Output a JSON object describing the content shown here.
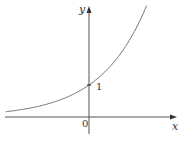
{
  "chart_data": {
    "type": "line",
    "title": "",
    "function": "y = 2^x",
    "xlabel": "x",
    "ylabel": "y",
    "origin_label": "0",
    "annotations": [
      {
        "x": 0,
        "y": 1,
        "label": "1"
      }
    ],
    "xlim": [
      -2.6,
      2.7
    ],
    "ylim": [
      -0.5,
      3.4
    ],
    "grid": false,
    "legend": null,
    "series": [
      {
        "name": "exponential curve",
        "x": [
          -2.6,
          -2,
          -1.5,
          -1,
          -0.5,
          0,
          0.5,
          1,
          1.5,
          1.8
        ],
        "y": [
          0.16,
          0.25,
          0.35,
          0.5,
          0.71,
          1,
          1.41,
          2,
          2.83,
          3.48
        ]
      }
    ]
  },
  "labels": {
    "x_axis": "x",
    "y_axis": "y",
    "origin": "0",
    "y_intercept": "1"
  },
  "colors": {
    "axis": "#555555",
    "curve": "#777777",
    "text": "#333333"
  }
}
